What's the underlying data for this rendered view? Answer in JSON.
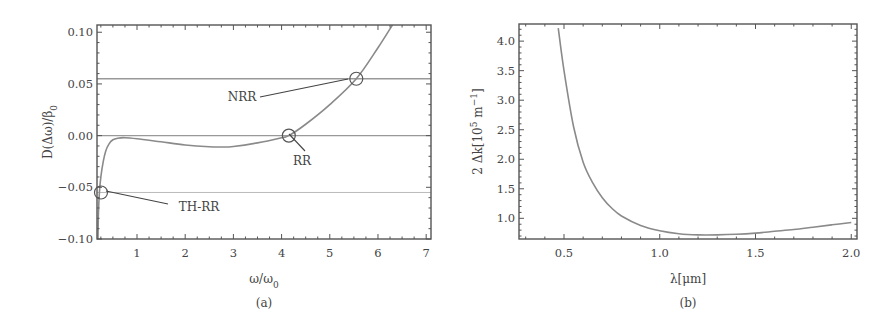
{
  "chart_data": [
    {
      "type": "line",
      "panel_label": "(a)",
      "title": "",
      "xlabel": "ω/ω0",
      "ylabel": "D(Δω)/β0",
      "xlim": [
        0.17,
        7.1
      ],
      "ylim": [
        -0.1,
        0.107
      ],
      "xticks": [
        1,
        2,
        3,
        4,
        5,
        6,
        7
      ],
      "xtick_labels": [
        "1",
        "2",
        "3",
        "4",
        "5",
        "6",
        "7"
      ],
      "yticks": [
        0.1,
        0.05,
        0.0,
        -0.05,
        -0.1
      ],
      "ytick_labels": [
        "0.10",
        "0.05",
        "0.00",
        "−0.05",
        "−0.10"
      ],
      "grid": false,
      "series": [
        {
          "name": "D(Δω)/β0",
          "x": [
            0.19,
            0.2,
            0.22,
            0.25,
            0.3,
            0.35,
            0.42,
            0.5,
            0.6,
            0.75,
            1.0,
            1.5,
            2.0,
            2.5,
            2.75,
            3.0,
            3.5,
            4.0,
            4.15,
            4.5,
            5.0,
            5.55,
            6.0,
            6.3
          ],
          "y": [
            -0.1,
            -0.075,
            -0.055,
            -0.04,
            -0.025,
            -0.015,
            -0.008,
            -0.004,
            -0.0025,
            -0.002,
            -0.003,
            -0.006,
            -0.009,
            -0.0108,
            -0.011,
            -0.0105,
            -0.007,
            -0.002,
            0.0,
            0.011,
            0.03,
            0.055,
            0.085,
            0.107
          ]
        }
      ],
      "horizontal_lines": [
        {
          "y": 0.055,
          "label": "NRR"
        },
        {
          "y": 0.0,
          "label": "RR"
        },
        {
          "y": -0.055,
          "label": "TH-RR"
        }
      ],
      "annotations": [
        {
          "text": "NRR",
          "x": 5.55,
          "y": 0.055
        },
        {
          "text": "RR",
          "x": 4.15,
          "y": 0.0
        },
        {
          "text": "TH-RR",
          "x": 0.22,
          "y": -0.055
        }
      ]
    },
    {
      "type": "line",
      "panel_label": "(b)",
      "title": "",
      "xlabel": "λ[μm]",
      "ylabel": "2 Δk[10^5 m^−1]",
      "xlim": [
        0.265,
        2.03
      ],
      "ylim": [
        0.65,
        4.29
      ],
      "xticks": [
        0.5,
        1.0,
        1.5,
        2.0
      ],
      "xtick_labels": [
        "0.5",
        "1.0",
        "1.5",
        "2.0"
      ],
      "yticks": [
        1.0,
        1.5,
        2.0,
        2.5,
        3.0,
        3.5,
        4.0
      ],
      "ytick_labels": [
        "1.0",
        "1.5",
        "2.0",
        "2.5",
        "3.0",
        "3.5",
        "4.0"
      ],
      "grid": false,
      "series": [
        {
          "name": "2Δk",
          "x": [
            0.47,
            0.5,
            0.55,
            0.6,
            0.65,
            0.7,
            0.75,
            0.8,
            0.9,
            1.0,
            1.1,
            1.2,
            1.3,
            1.4,
            1.5,
            1.6,
            1.7,
            1.8,
            1.9,
            2.0
          ],
          "y": [
            4.22,
            3.5,
            2.55,
            1.95,
            1.6,
            1.35,
            1.17,
            1.04,
            0.88,
            0.79,
            0.74,
            0.72,
            0.72,
            0.73,
            0.75,
            0.78,
            0.81,
            0.85,
            0.89,
            0.93
          ]
        }
      ]
    }
  ]
}
